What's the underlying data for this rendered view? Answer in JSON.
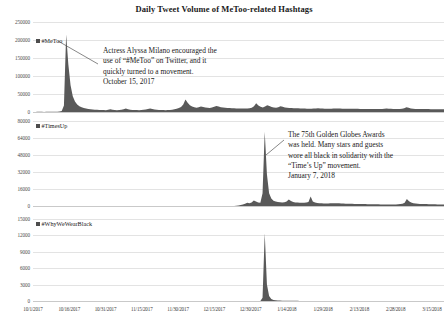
{
  "title": "Daily Tweet Volume of MeToo-related Hashtags",
  "colors": {
    "series_fill": "#595959",
    "gridline": "#e3e3e3",
    "text": "#1a1a1a",
    "tick_text": "#4a4a4a"
  },
  "x_axis": {
    "tick_labels": [
      "10/1/2017",
      "10/16/2017",
      "10/31/2017",
      "11/15/2017",
      "11/30/2017",
      "12/15/2017",
      "12/30/2017",
      "1/14/2018",
      "1/29/2018",
      "2/13/2018",
      "2/28/2018",
      "3/15/2018"
    ]
  },
  "panels": [
    {
      "legend_label": "#MeToo",
      "y_ticks": [
        "0",
        "50000",
        "100000",
        "150000",
        "200000",
        "250000"
      ],
      "annotation": {
        "lines": [
          "Actress Alyssa Milano encouraged the",
          "use of “#MeToo” on Twitter, and it",
          "quickly turned to a movement.",
          "October 15, 2017"
        ]
      }
    },
    {
      "legend_label": "#TimesUp",
      "y_ticks": [
        "0",
        "16000",
        "32000",
        "48000",
        "64000",
        "80000"
      ],
      "annotation": {
        "lines": [
          "The 75th Golden Globes Awards",
          "was held. Many stars and guests",
          "wore all black in solidarity with the",
          "“Time’s Up” movement.",
          "January 7, 2018"
        ]
      }
    },
    {
      "legend_label": "#WhyWeWearBlack",
      "y_ticks": [
        "0",
        "3000",
        "6000",
        "9000",
        "12000",
        "15000"
      ],
      "annotation": null
    }
  ],
  "chart_data": {
    "type": "area",
    "title": "Daily Tweet Volume of MeToo-related Hashtags",
    "xlabel": "",
    "ylabel": "",
    "grid": true,
    "legend_position": "inside-top-left",
    "x_start": "10/1/2017",
    "x_end": "3/20/2018",
    "x_tick_labels": [
      "10/1/2017",
      "10/16/2017",
      "10/31/2017",
      "11/15/2017",
      "11/30/2017",
      "12/15/2017",
      "12/30/2017",
      "1/14/2018",
      "1/29/2018",
      "2/13/2018",
      "2/28/2018",
      "3/15/2018"
    ],
    "annotations": [
      {
        "panel": "#MeToo",
        "text": "Actress Alyssa Milano encouraged the use of “#MeToo” on Twitter, and it quickly turned to a movement. October 15, 2017",
        "date": "10/15/2017"
      },
      {
        "panel": "#TimesUp",
        "text": "The 75th Golden Globes Awards was held. Many stars and guests wore all black in solidarity with the “Time’s Up” movement. January 7, 2018",
        "date": "1/7/2018"
      }
    ],
    "series": [
      {
        "name": "#MeToo",
        "ylim": [
          0,
          250000
        ],
        "y_ticks": [
          0,
          50000,
          100000,
          150000,
          200000,
          250000
        ],
        "peak_date": "10/16/2017",
        "peak_value": 215000,
        "values": [
          300,
          300,
          400,
          400,
          350,
          300,
          350,
          400,
          400,
          450,
          600,
          900,
          1400,
          2600,
          18000,
          215000,
          132000,
          74000,
          44000,
          29000,
          21000,
          16000,
          13000,
          11000,
          9500,
          8500,
          7600,
          7000,
          6500,
          6100,
          5800,
          5500,
          5300,
          5200,
          6400,
          7500,
          6400,
          5500,
          5200,
          5400,
          6200,
          7800,
          9400,
          7600,
          6400,
          5800,
          5500,
          5300,
          5200,
          5400,
          6000,
          7000,
          8400,
          9800,
          8200,
          6800,
          6000,
          5600,
          5400,
          5300,
          5200,
          5300,
          5600,
          6400,
          7800,
          9200,
          11000,
          14000,
          21000,
          35000,
          26000,
          19000,
          15000,
          13000,
          12000,
          13500,
          15500,
          14000,
          12500,
          11500,
          11000,
          12500,
          14500,
          16500,
          15000,
          13500,
          12500,
          11800,
          11200,
          10800,
          10400,
          10200,
          10000,
          9800,
          9700,
          9600,
          9600,
          9700,
          10500,
          12000,
          16000,
          24000,
          18000,
          14500,
          12500,
          15500,
          19000,
          16500,
          14000,
          12500,
          12000,
          13500,
          16000,
          14500,
          12800,
          11800,
          11200,
          10800,
          10500,
          10300,
          10100,
          9900,
          9700,
          9500,
          9300,
          9200,
          9200,
          9400,
          9800,
          10200,
          10000,
          9600,
          9300,
          9100,
          9000,
          9200,
          9600,
          10000,
          9700,
          9400,
          9200,
          9000,
          8900,
          8900,
          9000,
          9200,
          9000,
          8800,
          8600,
          8500,
          8400,
          8300,
          8200,
          8100,
          8000,
          8000,
          8100,
          8300,
          8600,
          9000,
          9400,
          9200,
          8800,
          8500,
          8300,
          8200,
          8400,
          8800,
          10500,
          13500,
          11500,
          9800,
          9000,
          8600,
          8400,
          8300,
          8200,
          8100,
          8000,
          8000,
          7900,
          7900,
          7800,
          7800,
          7700,
          7600,
          7500
        ]
      },
      {
        "name": "#TimesUp",
        "ylim": [
          0,
          80000
        ],
        "y_ticks": [
          0,
          16000,
          32000,
          48000,
          64000,
          80000
        ],
        "peak_date": "1/7/2018",
        "peak_value": 70000,
        "values": [
          0,
          0,
          0,
          0,
          0,
          0,
          0,
          0,
          0,
          0,
          0,
          0,
          0,
          0,
          0,
          0,
          0,
          0,
          0,
          0,
          0,
          0,
          0,
          0,
          0,
          0,
          0,
          0,
          0,
          0,
          0,
          0,
          0,
          0,
          0,
          0,
          0,
          0,
          0,
          0,
          0,
          0,
          0,
          0,
          0,
          0,
          0,
          0,
          0,
          0,
          0,
          0,
          0,
          0,
          0,
          0,
          0,
          0,
          0,
          0,
          0,
          0,
          0,
          0,
          0,
          0,
          0,
          0,
          0,
          0,
          0,
          0,
          0,
          0,
          0,
          0,
          0,
          0,
          0,
          0,
          0,
          0,
          0,
          0,
          0,
          0,
          0,
          0,
          0,
          0,
          0,
          0,
          0,
          200,
          500,
          900,
          1400,
          2200,
          3000,
          2600,
          3200,
          5200,
          4200,
          3400,
          3000,
          12000,
          70000,
          30000,
          12000,
          7000,
          5000,
          4200,
          3800,
          3500,
          3400,
          3600,
          4200,
          6200,
          4800,
          3800,
          3400,
          3200,
          3100,
          3000,
          3000,
          3200,
          3800,
          9000,
          4200,
          3200,
          2800,
          2600,
          2500,
          2400,
          2400,
          2400,
          2500,
          2600,
          2700,
          2600,
          2500,
          2400,
          2300,
          2200,
          2200,
          2100,
          2100,
          2000,
          2000,
          1900,
          1900,
          1800,
          1800,
          1700,
          1700,
          1700,
          1600,
          1600,
          1600,
          1500,
          1500,
          1500,
          1400,
          1400,
          1400,
          1400,
          1500,
          1600,
          1800,
          2200,
          3000,
          6500,
          4500,
          3200,
          2600,
          2300,
          2100,
          2000,
          1900,
          1800,
          1800,
          1700,
          1700,
          1600,
          1600,
          1500,
          1500,
          1400,
          1400
        ]
      },
      {
        "name": "#WhyWeWearBlack",
        "ylim": [
          0,
          15000
        ],
        "y_ticks": [
          0,
          3000,
          6000,
          9000,
          12000,
          15000
        ],
        "peak_date": "1/7/2018",
        "peak_value": 12400,
        "values": [
          0,
          0,
          0,
          0,
          0,
          0,
          0,
          0,
          0,
          0,
          0,
          0,
          0,
          0,
          0,
          0,
          0,
          0,
          0,
          0,
          0,
          0,
          0,
          0,
          0,
          0,
          0,
          0,
          0,
          0,
          0,
          0,
          0,
          0,
          0,
          0,
          0,
          0,
          0,
          0,
          0,
          0,
          0,
          0,
          0,
          0,
          0,
          0,
          0,
          0,
          0,
          0,
          0,
          0,
          0,
          0,
          0,
          0,
          0,
          0,
          0,
          0,
          0,
          0,
          0,
          0,
          0,
          0,
          0,
          0,
          0,
          0,
          0,
          0,
          0,
          0,
          0,
          0,
          0,
          0,
          0,
          0,
          0,
          0,
          0,
          0,
          0,
          0,
          0,
          0,
          0,
          0,
          0,
          0,
          0,
          0,
          0,
          0,
          0,
          0,
          0,
          0,
          0,
          0,
          0,
          600,
          12400,
          3000,
          900,
          350,
          180,
          120,
          90,
          70,
          60,
          50,
          45,
          40,
          35,
          30,
          28,
          25,
          22,
          20,
          18,
          16,
          15,
          14,
          12,
          11,
          10,
          10,
          9,
          8,
          8,
          7,
          7,
          6,
          6,
          5,
          5,
          5,
          4,
          4,
          4,
          3,
          3,
          3,
          3,
          2,
          2,
          2,
          2,
          2,
          2,
          2,
          2,
          1,
          1,
          1,
          1,
          1,
          1,
          1,
          1,
          1,
          1,
          1,
          1,
          1,
          1,
          1,
          1,
          1,
          1,
          1,
          1,
          1,
          1,
          1,
          1,
          1,
          1,
          1,
          1,
          1,
          1,
          1,
          1
        ]
      }
    ]
  }
}
